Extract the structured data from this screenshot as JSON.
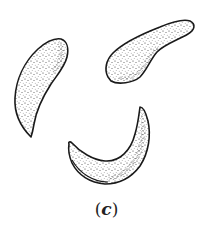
{
  "figure": {
    "caption_open": "(",
    "caption_label": "c",
    "caption_close": ")",
    "colors": {
      "outline": "#1a1a1a",
      "stipple": "#333333",
      "background": "#ffffff"
    },
    "shapes": [
      {
        "name": "comma-cell-left",
        "orientation": "curving down-left, tapered tip at bottom"
      },
      {
        "name": "comma-cell-top-right",
        "orientation": "bean shape, thick lobe at left, tapering to the upper right"
      },
      {
        "name": "crescent-cell-bottom",
        "orientation": "crescent opening upward, horns at upper-left and upper-right"
      }
    ]
  }
}
